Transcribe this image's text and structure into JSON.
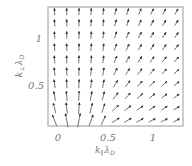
{
  "chart_data": {
    "type": "quiver",
    "title": "",
    "xlabel": "k∥ λD",
    "ylabel": "k⊥ λD",
    "xlabel_main": "k",
    "xlabel_sub1": "∥",
    "xlabel_lambda": "λ",
    "xlabel_sub2": "D",
    "ylabel_main": "k",
    "ylabel_sub1": "⊥",
    "ylabel_lambda": "λ",
    "ylabel_sub2": "D",
    "xlim": [
      -0.12,
      1.32
    ],
    "ylim": [
      0.0,
      1.27
    ],
    "x_ticks": [
      {
        "value": 0,
        "label": "0"
      },
      {
        "value": 0.5,
        "label": "0.5"
      },
      {
        "value": 1,
        "label": "1"
      }
    ],
    "y_ticks": [
      {
        "value": 0.5,
        "label": "0.5"
      },
      {
        "value": 1,
        "label": "1"
      }
    ],
    "grid": false,
    "legend": null,
    "field": {
      "description": "Vector field diverging from near origin; arrows point upward at small k∥, rotating toward +k∥ direction at large k∥ and small k⊥; long arrows near lower-left corner",
      "columns_x": [
        -0.05,
        0.08,
        0.21,
        0.34,
        0.47,
        0.6,
        0.73,
        0.86,
        0.99,
        1.12,
        1.25
      ],
      "rows_y": [
        0.06,
        0.19,
        0.32,
        0.45,
        0.58,
        0.71,
        0.84,
        0.97,
        1.1,
        1.22
      ]
    },
    "colors": {
      "frame": "#9a9a9a",
      "arrow": "#333333",
      "text": "#777777",
      "background": "#ffffff"
    }
  }
}
